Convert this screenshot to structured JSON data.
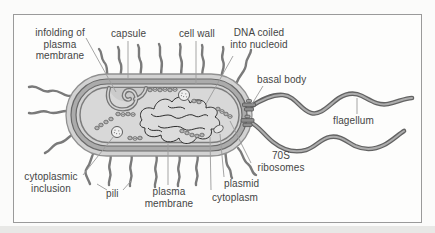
{
  "figure": {
    "type": "labeled-diagram",
    "labels": {
      "infolding": {
        "lines": [
          "infolding of",
          "plasma",
          "membrane"
        ]
      },
      "capsule": {
        "text": "capsule"
      },
      "cell_wall": {
        "text": "cell wall"
      },
      "dna_nucleoid": {
        "lines": [
          "DNA coiled",
          "into nucleoid"
        ]
      },
      "basal_body": {
        "text": "basal body"
      },
      "flagellum": {
        "text": "flagellum"
      },
      "ribosomes_70s": {
        "lines": [
          "70S",
          "ribosomes"
        ]
      },
      "plasmid": {
        "text": "plasmid"
      },
      "cytoplasm": {
        "text": "cytoplasm"
      },
      "plasma_membrane": {
        "lines": [
          "plasma",
          "membrane"
        ]
      },
      "pili": {
        "text": "pili"
      },
      "cytoplasmic_inclusion": {
        "lines": [
          "cytoplasmic",
          "inclusion"
        ]
      }
    },
    "colors": {
      "frame_border": "#9a9a9a",
      "capsule_fill": "#d2d2d2",
      "cell_wall_fill": "#ababab",
      "cytoplasm_fill": "#d8d8d8",
      "layer_outline": "#6a6a6a",
      "appendage_gray": "#7a7a7a",
      "flagellum_dark": "#636363",
      "flagellum_light": "#adadad",
      "dna_ink": "#2e2e2e",
      "leader_line": "#9b9b9b",
      "label_text": "#454545"
    }
  }
}
